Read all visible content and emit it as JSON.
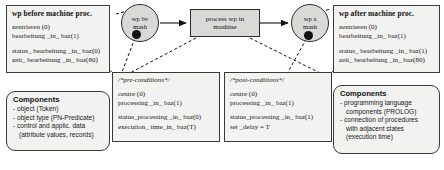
{
  "diagram": {
    "left_state": {
      "title": "wp before machine  proc.",
      "lines_top": [
        "zentrieren (0)",
        "bearbeitung _in_ baz(1)"
      ],
      "lines_bottom": [
        "status_ bearbeitung _in_ baz(0)",
        "zeit_ bearbeitung _in_ baz(80)"
      ]
    },
    "right_state": {
      "title": "wp after machine  proc.",
      "lines_top": [
        "zentrieren (0)",
        "bearbeitung _in_ baz(1)"
      ],
      "lines_bottom": [
        "status_ bearbeitung _in_ baz(1)",
        "zeit_ bearbeitung _in_ baz(80)"
      ]
    },
    "place_before": {
      "line1": "wp bv",
      "line2": "mash"
    },
    "place_after": {
      "line1": "wp a",
      "line2": "mash"
    },
    "transition": {
      "line1": "process wp in",
      "line2": "mashine"
    },
    "preconditions": {
      "title": "/*pre-conditions*/",
      "lines_top": [
        "centre (0)",
        "processing _in_ baz(1)"
      ],
      "lines_bottom": [
        "status_processing _in_  baz(0)",
        "execution_ time_in_  baz(T)"
      ]
    },
    "postconditions": {
      "title": "/*post-conditions*/",
      "lines_top": [
        "centre (0)",
        "processing _in_ baz(1)"
      ],
      "lines_bottom": [
        "status_processing _in_  baz(1)",
        "set _delay =  T"
      ]
    },
    "components_left": {
      "title": "Components",
      "items": [
        "- object (Token)",
        "- object type (PN-Predicate)",
        "- control and  applic.  data",
        "(attribute values, records)"
      ]
    },
    "components_right": {
      "title": "Components",
      "items": [
        "- programming language",
        "components (PROLOG)",
        "- connection of procedures",
        "with adjacent states",
        "(execution time)"
      ]
    }
  }
}
